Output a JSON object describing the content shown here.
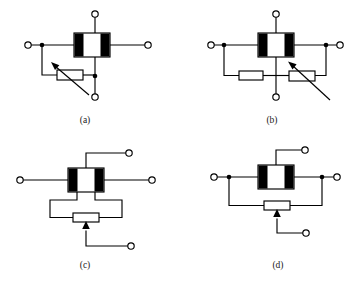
{
  "figure": {
    "background_color": "#ffffff",
    "line_color": "#000000",
    "caption_color": "#1a1a1a",
    "panels": [
      {
        "id": "a",
        "caption": "(a)",
        "caption_x": 85,
        "caption_y": 123,
        "device": {
          "name": "block-element",
          "x": 74,
          "y": 33,
          "w": 36,
          "h": 24,
          "bar_width": 9
        },
        "terminals": [
          {
            "name": "terminal-top",
            "cx": 95,
            "cy": 14,
            "r": 3.2
          },
          {
            "name": "terminal-left",
            "cx": 28,
            "cy": 45,
            "r": 3.2
          },
          {
            "name": "terminal-right",
            "cx": 148,
            "cy": 45,
            "r": 3.2
          },
          {
            "name": "terminal-bottom",
            "cx": 95,
            "cy": 97,
            "r": 3.2
          }
        ],
        "junctions": [
          {
            "name": "junction-left",
            "cx": 42,
            "cy": 45,
            "r": 2.3
          },
          {
            "name": "junction-bottom",
            "cx": 95,
            "cy": 76,
            "r": 2.3
          }
        ],
        "resistor": {
          "name": "variable-resistor",
          "x": 57,
          "y": 70,
          "w": 26,
          "h": 10,
          "variable": true,
          "arrow_from": [
            89,
            95
          ],
          "arrow_to": [
            51,
            63
          ]
        }
      },
      {
        "id": "b",
        "caption": "(b)",
        "caption_x": 272,
        "caption_y": 123,
        "device": {
          "name": "block-element",
          "x": 258,
          "y": 33,
          "w": 36,
          "h": 24,
          "bar_width": 9
        },
        "terminals": [
          {
            "name": "terminal-top",
            "cx": 276,
            "cy": 14,
            "r": 3.2
          },
          {
            "name": "terminal-left",
            "cx": 211,
            "cy": 45,
            "r": 3.2
          },
          {
            "name": "terminal-right",
            "cx": 340,
            "cy": 45,
            "r": 3.2
          },
          {
            "name": "terminal-bottom",
            "cx": 276,
            "cy": 97,
            "r": 3.2
          }
        ],
        "junctions": [
          {
            "name": "junction-left",
            "cx": 224,
            "cy": 45,
            "r": 2.3
          },
          {
            "name": "junction-right",
            "cx": 326,
            "cy": 45,
            "r": 2.3
          }
        ],
        "resistor_fixed": {
          "name": "fixed-resistor",
          "x": 239,
          "y": 71,
          "w": 24,
          "h": 9
        },
        "resistor_variable": {
          "name": "variable-resistor",
          "x": 289,
          "y": 71,
          "w": 26,
          "h": 10,
          "arrow_from": [
            330,
            100
          ],
          "arrow_to": [
            288,
            62
          ]
        }
      },
      {
        "id": "c",
        "caption": "(c)",
        "caption_x": 85,
        "caption_y": 268,
        "device": {
          "name": "block-element",
          "x": 68,
          "y": 168,
          "w": 36,
          "h": 24,
          "bar_width": 9
        },
        "terminals": [
          {
            "name": "terminal-top",
            "cx": 129,
            "cy": 153,
            "r": 3.2
          },
          {
            "name": "terminal-left",
            "cx": 20,
            "cy": 180,
            "r": 3.2
          },
          {
            "name": "terminal-right",
            "cx": 152,
            "cy": 180,
            "r": 3.2
          },
          {
            "name": "terminal-wiper",
            "cx": 131,
            "cy": 246,
            "r": 3.2
          }
        ],
        "junctions": [],
        "potentiometer": {
          "name": "potentiometer",
          "x": 73,
          "y": 213,
          "w": 26,
          "h": 9,
          "wiper_x": 86,
          "wiper_bottom": 246,
          "left_leg_x": 50,
          "right_leg_x": 122
        }
      },
      {
        "id": "d",
        "caption": "(d)",
        "caption_x": 278,
        "caption_y": 268,
        "device": {
          "name": "block-element",
          "x": 258,
          "y": 165,
          "w": 36,
          "h": 24,
          "bar_width": 9
        },
        "terminals": [
          {
            "name": "terminal-top",
            "cx": 305,
            "cy": 150,
            "r": 3.2
          },
          {
            "name": "terminal-left",
            "cx": 214,
            "cy": 177,
            "r": 3.2
          },
          {
            "name": "terminal-right",
            "cx": 337,
            "cy": 177,
            "r": 3.2
          },
          {
            "name": "terminal-wiper",
            "cx": 306,
            "cy": 233,
            "r": 3.2
          }
        ],
        "junctions": [
          {
            "name": "junction-left",
            "cx": 229,
            "cy": 177,
            "r": 2.3
          },
          {
            "name": "junction-right",
            "cx": 322,
            "cy": 177,
            "r": 2.3
          }
        ],
        "potentiometer": {
          "name": "potentiometer",
          "x": 264,
          "y": 201,
          "w": 26,
          "h": 9,
          "wiper_x": 277,
          "wiper_bottom": 233,
          "left_leg_x": 229,
          "right_leg_x": 322
        }
      }
    ]
  }
}
